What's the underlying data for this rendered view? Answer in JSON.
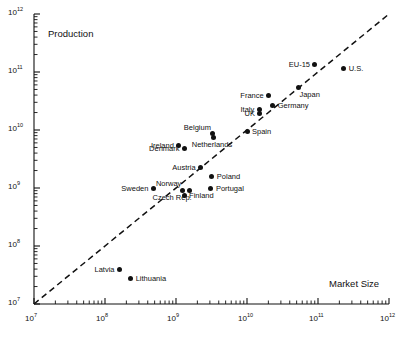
{
  "chart_data": {
    "type": "scatter",
    "title": "",
    "xlabel": "Market Size",
    "ylabel": "Production",
    "xscale": "log",
    "yscale": "log",
    "xlim": [
      10000000,
      1000000000000
    ],
    "ylim": [
      10000000,
      1000000000000
    ],
    "grid": false,
    "legend": null,
    "xticks": [
      {
        "value": 10000000,
        "label_base": "10",
        "label_exp": "7"
      },
      {
        "value": 100000000,
        "label_base": "10",
        "label_exp": "8"
      },
      {
        "value": 1000000000,
        "label_base": "10",
        "label_exp": "9"
      },
      {
        "value": 10000000000,
        "label_base": "10",
        "label_exp": "10"
      },
      {
        "value": 100000000000,
        "label_base": "10",
        "label_exp": "11"
      },
      {
        "value": 1000000000000,
        "label_base": "10",
        "label_exp": "12"
      }
    ],
    "yticks": [
      {
        "value": 10000000,
        "label_base": "10",
        "label_exp": "7"
      },
      {
        "value": 100000000,
        "label_base": "10",
        "label_exp": "8"
      },
      {
        "value": 1000000000,
        "label_base": "10",
        "label_exp": "9"
      },
      {
        "value": 10000000000,
        "label_base": "10",
        "label_exp": "10"
      },
      {
        "value": 100000000000,
        "label_base": "10",
        "label_exp": "11"
      },
      {
        "value": 1000000000000,
        "label_base": "10",
        "label_exp": "12"
      }
    ],
    "reference_line": {
      "style": "dashed",
      "description": "45-degree identity line y = x",
      "from": [
        10000000,
        10000000
      ],
      "to": [
        1000000000000,
        1000000000000
      ]
    },
    "points": [
      {
        "name": "U.S.",
        "x": 230000000000.0,
        "y": 115000000000.0,
        "label_pos": "right"
      },
      {
        "name": "EU-15",
        "x": 90000000000.0,
        "y": 135000000000.0,
        "label_pos": "left"
      },
      {
        "name": "Japan",
        "x": 53000000000.0,
        "y": 55000000000.0,
        "label_pos": "below-right"
      },
      {
        "name": "France",
        "x": 20000000000.0,
        "y": 39000000000.0,
        "label_pos": "left"
      },
      {
        "name": "Germany",
        "x": 23000000000.0,
        "y": 26000000000.0,
        "label_pos": "right"
      },
      {
        "name": "Italy",
        "x": 15000000000.0,
        "y": 23000000000.0,
        "label_pos": "left"
      },
      {
        "name": "UK",
        "x": 15000000000.0,
        "y": 19000000000.0,
        "label_pos": "left"
      },
      {
        "name": "Spain",
        "x": 10000000000.0,
        "y": 9600000000.0,
        "label_pos": "right"
      },
      {
        "name": "Belgium",
        "x": 3300000000.0,
        "y": 8600000000.0,
        "label_pos": "above-left"
      },
      {
        "name": "Netherlands",
        "x": 3400000000.0,
        "y": 7300000000.0,
        "label_pos": "below"
      },
      {
        "name": "Ireland",
        "x": 1100000000.0,
        "y": 5500000000.0,
        "label_pos": "left"
      },
      {
        "name": "Denmark",
        "x": 1300000000.0,
        "y": 4800000000.0,
        "label_pos": "left"
      },
      {
        "name": "Austria",
        "x": 2200000000.0,
        "y": 2300000000.0,
        "label_pos": "left"
      },
      {
        "name": "Poland",
        "x": 3200000000.0,
        "y": 1600000000.0,
        "label_pos": "right"
      },
      {
        "name": "Portugal",
        "x": 3100000000.0,
        "y": 1000000000.0,
        "label_pos": "right"
      },
      {
        "name": "Sweden",
        "x": 480000000.0,
        "y": 1000000000.0,
        "label_pos": "left"
      },
      {
        "name": "Norway",
        "x": 1250000000.0,
        "y": 910000000.0,
        "label_pos": "above-left"
      },
      {
        "name": "Czech Rep.",
        "x": 1550000000.0,
        "y": 910000000.0,
        "label_pos": "below-left"
      },
      {
        "name": "Finland",
        "x": 1300000000.0,
        "y": 730000000.0,
        "label_pos": "right"
      },
      {
        "name": "Latvia",
        "x": 160000000.0,
        "y": 40000000.0,
        "label_pos": "left"
      },
      {
        "name": "Lithuania",
        "x": 230000000.0,
        "y": 28000000.0,
        "label_pos": "right"
      }
    ]
  },
  "colors": {
    "marker": "#111111",
    "axis": "#111111",
    "text": "#111111",
    "background": "#ffffff"
  }
}
